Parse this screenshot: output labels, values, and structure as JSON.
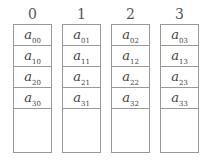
{
  "columns": [
    {
      "index": "0",
      "cells": [
        {
          "base": "a",
          "sub": "00"
        },
        {
          "base": "a",
          "sub": "10"
        },
        {
          "base": "a",
          "sub": "20"
        },
        {
          "base": "a",
          "sub": "30"
        }
      ]
    },
    {
      "index": "1",
      "cells": [
        {
          "base": "a",
          "sub": "01"
        },
        {
          "base": "a",
          "sub": "11"
        },
        {
          "base": "a",
          "sub": "21"
        },
        {
          "base": "a",
          "sub": "31"
        }
      ]
    },
    {
      "index": "2",
      "cells": [
        {
          "base": "a",
          "sub": "02"
        },
        {
          "base": "a",
          "sub": "12"
        },
        {
          "base": "a",
          "sub": "22"
        },
        {
          "base": "a",
          "sub": "32"
        }
      ]
    },
    {
      "index": "3",
      "cells": [
        {
          "base": "a",
          "sub": "03"
        },
        {
          "base": "a",
          "sub": "13"
        },
        {
          "base": "a",
          "sub": "23"
        },
        {
          "base": "a",
          "sub": "33"
        }
      ]
    }
  ]
}
